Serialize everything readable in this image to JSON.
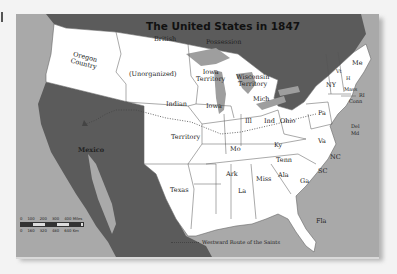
{
  "map": {
    "title": "The United States in 1847",
    "colors": {
      "us": "#ffffff",
      "foreign": "#5b5b5b",
      "ocean": "#a9a9a9",
      "lakes": "#9e9e9e",
      "border": "#555555",
      "background": "#f3f3f3"
    },
    "regions": {
      "british_possession": [
        "British",
        "Possession"
      ],
      "oregon": [
        "Oregon",
        "Country"
      ],
      "unorganized": "(Unorganized)",
      "iowa_territory": [
        "Iowa",
        "Territory"
      ],
      "wisconsin_territory": [
        "Wisconsin",
        "Territory"
      ],
      "indian_territory": [
        "Indian",
        "Territory"
      ],
      "mexico": "Mexico",
      "texas": "Texas"
    },
    "states": {
      "me": "Me",
      "vt": "Vt",
      "nh": "H",
      "ny": "NY",
      "mass": "Mass",
      "ri": "RI",
      "conn": "Conn",
      "nj": "NJ",
      "pa": "Pa",
      "del": "Del",
      "md": "Md",
      "mich": "Mich",
      "ohio": "Ohio",
      "ind": "Ind",
      "ill": "Ill",
      "iowa": "Iowa",
      "mo": "Mo",
      "ky": "Ky",
      "va": "Va",
      "nc": "NC",
      "tenn": "Tenn",
      "sc": "SC",
      "ark": "Ark",
      "miss": "Miss",
      "ala": "Ala",
      "ga": "Ga",
      "la": "La",
      "fla": "Fla"
    },
    "legend": {
      "label": "Westward Route of the Saints",
      "line_style": "dotted"
    },
    "scale": {
      "miles": [
        "0",
        "100",
        "200",
        "300",
        "400 Miles"
      ],
      "km": [
        "0",
        "160",
        "320",
        "480",
        "640 Km"
      ]
    }
  }
}
